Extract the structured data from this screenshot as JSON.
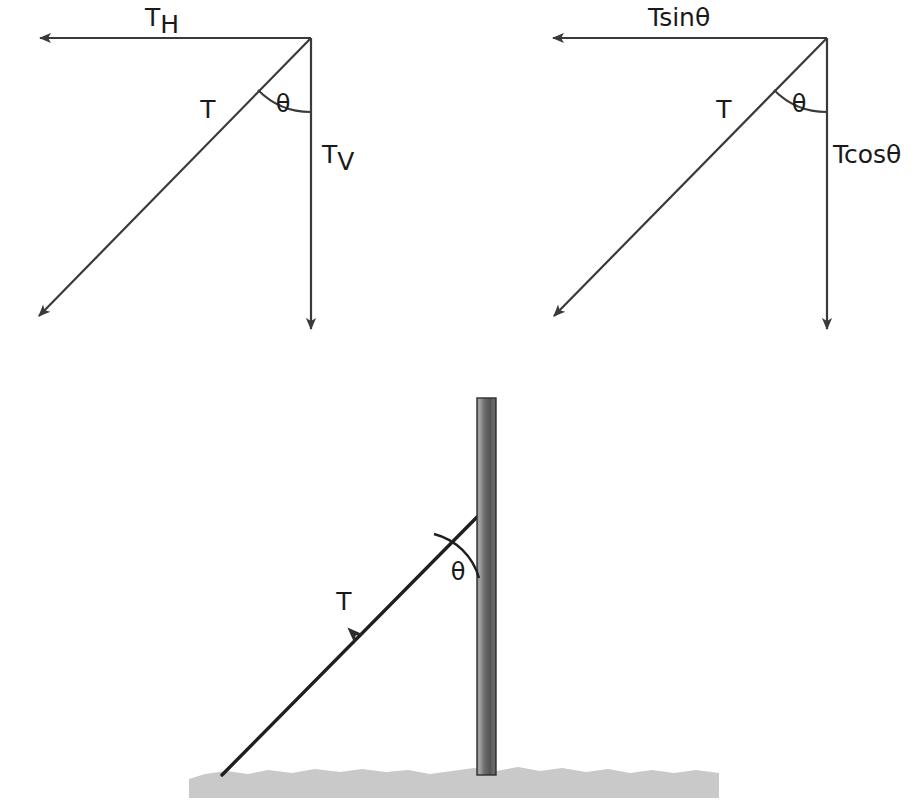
{
  "figure": {
    "background_color": "#ffffff",
    "stroke_color": "#3a3a3a",
    "text_color": "#1a1a1a",
    "width": 922,
    "height": 808
  },
  "panels": [
    {
      "id": "left-vector-triangle",
      "name": "generic-component-triangle",
      "vertex": {
        "x": 311,
        "y": 38
      },
      "labels": {
        "horizontal_base": "T",
        "horizontal_sub": "H",
        "horizontal_full": "TH",
        "vertical_base": "T",
        "vertical_sub": "V",
        "vertical_full": "TV",
        "hypotenuse": "T",
        "angle": "θ"
      },
      "label_positions": {
        "horizontal": {
          "x": 162,
          "y": 26
        },
        "vertical": {
          "x": 322,
          "y": 163
        },
        "hypotenuse": {
          "x": 208,
          "y": 118
        },
        "angle": {
          "x": 283,
          "y": 112
        }
      },
      "arrows": [
        {
          "name": "horizontal-component-arrow",
          "from": {
            "x": 311,
            "y": 38
          },
          "to": {
            "x": 33,
            "y": 38
          }
        },
        {
          "name": "vertical-component-arrow",
          "from": {
            "x": 311,
            "y": 38
          },
          "to": {
            "x": 311,
            "y": 336
          }
        },
        {
          "name": "tension-resultant-arrow",
          "from": {
            "x": 311,
            "y": 38
          },
          "to": {
            "x": 33,
            "y": 321
          }
        }
      ],
      "angle_arc": {
        "cx": 311,
        "cy": 38,
        "r": 74,
        "from_deg": 90,
        "to_deg": 135
      }
    },
    {
      "id": "right-vector-triangle",
      "name": "trigonometric-component-triangle",
      "vertex": {
        "x": 827,
        "y": 38
      },
      "labels": {
        "horizontal_full": "Tsinθ",
        "vertical_full": "Tcosθ",
        "hypotenuse": "T",
        "angle": "θ"
      },
      "label_positions": {
        "horizontal": {
          "x": 648,
          "y": 26
        },
        "vertical": {
          "x": 833,
          "y": 163
        },
        "hypotenuse": {
          "x": 724,
          "y": 118
        },
        "angle": {
          "x": 799,
          "y": 112
        }
      },
      "arrows": [
        {
          "name": "tsin-theta-arrow",
          "from": {
            "x": 827,
            "y": 38
          },
          "to": {
            "x": 546,
            "y": 38
          }
        },
        {
          "name": "tcos-theta-arrow",
          "from": {
            "x": 827,
            "y": 38
          },
          "to": {
            "x": 827,
            "y": 336
          }
        },
        {
          "name": "tension-resultant-arrow",
          "from": {
            "x": 827,
            "y": 38
          },
          "to": {
            "x": 548,
            "y": 321
          }
        }
      ],
      "angle_arc": {
        "cx": 827,
        "cy": 38,
        "r": 74,
        "from_deg": 90,
        "to_deg": 135
      }
    },
    {
      "id": "pole-scene",
      "name": "pole-and-guy-wire-scene",
      "labels": {
        "tension": "T",
        "angle": "θ"
      },
      "label_positions": {
        "tension": {
          "x": 344,
          "y": 610
        },
        "angle": {
          "x": 458,
          "y": 580
        }
      },
      "pole": {
        "name": "vertical-pole",
        "x": 477,
        "y": 398,
        "width": 19,
        "height": 377,
        "color_light": "#9a9a9a",
        "color_dark": "#4d4d4d",
        "outline_color": "#2e2e2e"
      },
      "ground": {
        "name": "ground-strip",
        "x": 189,
        "y": 766,
        "width": 530,
        "height": 32,
        "color": "#c9c9c9"
      },
      "guy_wire": {
        "name": "guy-wire-rope",
        "from": {
          "x": 222,
          "y": 775
        },
        "to": {
          "x": 479,
          "y": 515
        },
        "arrow_at": {
          "x": 358,
          "y": 638
        },
        "arrow_direction": "down-left"
      },
      "angle_arc": {
        "cx": 479,
        "cy": 515,
        "r": 63,
        "from_deg": 90,
        "to_deg": 135
      }
    }
  ]
}
